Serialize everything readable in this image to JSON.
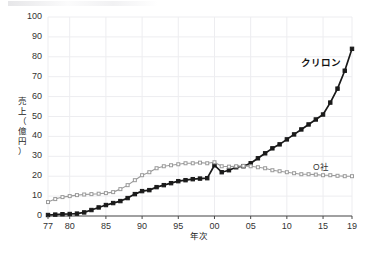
{
  "chart_data": {
    "type": "line",
    "title": "",
    "xlabel": "年次",
    "ylabel": "売上（億円）",
    "ylabel_chars": [
      "売",
      "上",
      "（",
      "億",
      "円",
      "）"
    ],
    "ylim": [
      0,
      100
    ],
    "ytick_values": [
      0,
      10,
      20,
      30,
      40,
      50,
      60,
      70,
      80,
      90,
      100
    ],
    "ytick_labels": [
      "0",
      "10",
      "20",
      "30",
      "40",
      "50",
      "60",
      "70",
      "80",
      "90",
      "100"
    ],
    "xlim": [
      1977,
      2019
    ],
    "xtick_values": [
      1977,
      1980,
      1985,
      1990,
      1995,
      2000,
      2005,
      2010,
      2015,
      2019
    ],
    "xtick_labels": [
      "77",
      "80",
      "85",
      "90",
      "95",
      "00",
      "05",
      "10",
      "15",
      "19"
    ],
    "grid": true,
    "legend_position": "inline-annotation",
    "x": [
      1977,
      1978,
      1979,
      1980,
      1981,
      1982,
      1983,
      1984,
      1985,
      1986,
      1987,
      1988,
      1989,
      1990,
      1991,
      1992,
      1993,
      1994,
      1995,
      1996,
      1997,
      1998,
      1999,
      2000,
      2001,
      2002,
      2003,
      2004,
      2005,
      2006,
      2007,
      2008,
      2009,
      2010,
      2011,
      2012,
      2013,
      2014,
      2015,
      2016,
      2017,
      2018,
      2019
    ],
    "series": [
      {
        "name": "クリロン",
        "color": "#1a1a1a",
        "marker": "square",
        "values": [
          0.5,
          0.7,
          0.9,
          1.0,
          1.2,
          1.8,
          3.0,
          4.3,
          5.5,
          6.5,
          7.5,
          9.0,
          11.0,
          12.5,
          13.0,
          14.5,
          15.5,
          16.5,
          17.5,
          18.0,
          18.5,
          18.8,
          19.0,
          25.5,
          22.0,
          23.0,
          24.5,
          25.0,
          26.5,
          29.0,
          31.5,
          34.0,
          36.0,
          38.5,
          41.0,
          43.5,
          46.0,
          48.5,
          51.0,
          57.0,
          64.0,
          73.0,
          84.0
        ]
      },
      {
        "name": "O社",
        "color": "#9a9a9a",
        "marker": "square",
        "values": [
          7.0,
          8.5,
          9.5,
          10.0,
          10.5,
          10.8,
          11.0,
          11.2,
          11.5,
          12.0,
          13.5,
          15.5,
          18.0,
          20.5,
          22.0,
          24.0,
          25.0,
          25.5,
          26.0,
          26.5,
          26.5,
          26.8,
          26.5,
          27.0,
          25.0,
          24.8,
          25.0,
          25.2,
          25.0,
          24.5,
          24.0,
          23.0,
          22.5,
          22.0,
          21.5,
          21.0,
          21.0,
          20.8,
          20.5,
          20.5,
          20.2,
          20.0,
          20.0
        ]
      }
    ],
    "annotations": [
      {
        "text": "クリロン",
        "x": 2015,
        "y": 78,
        "style": "bold-dark"
      },
      {
        "text": "O社",
        "x": 2015,
        "y": 25,
        "style": "plain-gray"
      }
    ]
  }
}
